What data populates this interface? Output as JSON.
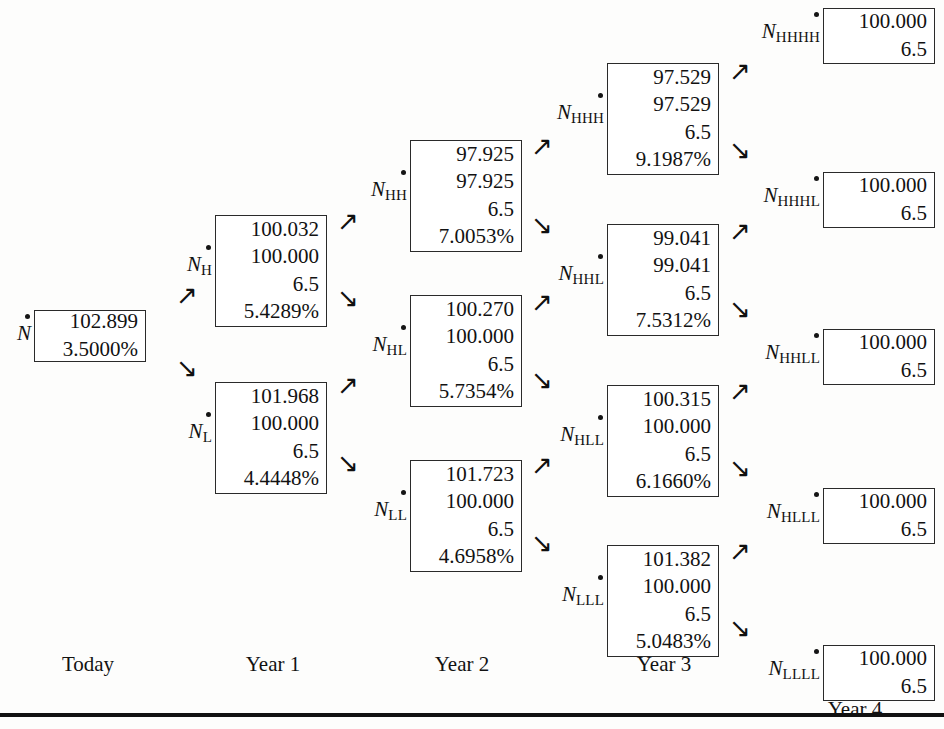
{
  "figure": {
    "type": "binomial-interest-rate-tree",
    "timeline": [
      {
        "label": "Today",
        "x": 88
      },
      {
        "label": "Year 1",
        "x": 273
      },
      {
        "label": "Year 2",
        "x": 462
      },
      {
        "label": "Year 3",
        "x": 664
      },
      {
        "label": "Year 4",
        "x": 855
      }
    ],
    "arrow_up_glyph": "↗",
    "arrow_down_glyph": "↘"
  },
  "nodes": [
    {
      "id": "N",
      "label": "N",
      "subscript": "",
      "values": [
        "102.899",
        "3.5000%"
      ],
      "x": 34,
      "y": 310,
      "w": 112,
      "h": 52,
      "label_w": 22
    },
    {
      "id": "NH",
      "label": "N",
      "subscript": "H",
      "values": [
        "100.032",
        "100.000",
        "6.5",
        "5.4289%"
      ],
      "x": 215,
      "y": 215,
      "w": 112,
      "h": 112,
      "label_w": 34
    },
    {
      "id": "NL",
      "label": "N",
      "subscript": "L",
      "values": [
        "101.968",
        "100.000",
        "6.5",
        "4.4448%"
      ],
      "x": 215,
      "y": 382,
      "w": 112,
      "h": 112,
      "label_w": 34
    },
    {
      "id": "NHH",
      "label": "N",
      "subscript": "HH",
      "values": [
        "97.925",
        "97.925",
        "6.5",
        "7.0053%"
      ],
      "x": 410,
      "y": 140,
      "w": 112,
      "h": 112,
      "label_w": 48
    },
    {
      "id": "NHL",
      "label": "N",
      "subscript": "HL",
      "values": [
        "100.270",
        "100.000",
        "6.5",
        "5.7354%"
      ],
      "x": 410,
      "y": 295,
      "w": 112,
      "h": 112,
      "label_w": 48
    },
    {
      "id": "NLL",
      "label": "N",
      "subscript": "LL",
      "values": [
        "101.723",
        "100.000",
        "6.5",
        "4.6958%"
      ],
      "x": 410,
      "y": 460,
      "w": 112,
      "h": 112,
      "label_w": 48
    },
    {
      "id": "NHHH",
      "label": "N",
      "subscript": "HHH",
      "values": [
        "97.529",
        "97.529",
        "6.5",
        "9.1987%"
      ],
      "x": 607,
      "y": 63,
      "w": 112,
      "h": 112,
      "label_w": 62
    },
    {
      "id": "NHHL",
      "label": "N",
      "subscript": "HHL",
      "values": [
        "99.041",
        "99.041",
        "6.5",
        "7.5312%"
      ],
      "x": 607,
      "y": 224,
      "w": 112,
      "h": 112,
      "label_w": 62
    },
    {
      "id": "NHLL",
      "label": "N",
      "subscript": "HLL",
      "values": [
        "100.315",
        "100.000",
        "6.5",
        "6.1660%"
      ],
      "x": 607,
      "y": 385,
      "w": 112,
      "h": 112,
      "label_w": 62
    },
    {
      "id": "NLLL",
      "label": "N",
      "subscript": "LLL",
      "values": [
        "101.382",
        "100.000",
        "6.5",
        "5.0483%"
      ],
      "x": 607,
      "y": 545,
      "w": 112,
      "h": 112,
      "label_w": 62
    },
    {
      "id": "NHHHH",
      "label": "N",
      "subscript": "HHHH",
      "values": [
        "100.000",
        "6.5"
      ],
      "x": 823,
      "y": 8,
      "w": 112,
      "h": 56,
      "label_w": 76
    },
    {
      "id": "NHHHL",
      "label": "N",
      "subscript": "HHHL",
      "values": [
        "100.000",
        "6.5"
      ],
      "x": 823,
      "y": 172,
      "w": 112,
      "h": 56,
      "label_w": 76
    },
    {
      "id": "NHHLL",
      "label": "N",
      "subscript": "HHLL",
      "values": [
        "100.000",
        "6.5"
      ],
      "x": 823,
      "y": 329,
      "w": 112,
      "h": 56,
      "label_w": 76
    },
    {
      "id": "NHLLL",
      "label": "N",
      "subscript": "HLLL",
      "values": [
        "100.000",
        "6.5"
      ],
      "x": 823,
      "y": 488,
      "w": 112,
      "h": 56,
      "label_w": 76
    },
    {
      "id": "NLLLL",
      "label": "N",
      "subscript": "LLLL",
      "values": [
        "100.000",
        "6.5"
      ],
      "x": 823,
      "y": 645,
      "w": 112,
      "h": 56,
      "label_w": 76
    }
  ],
  "arrows": [
    {
      "id": "N-up",
      "dir": "up",
      "x": 176,
      "y": 282
    },
    {
      "id": "N-down",
      "dir": "down",
      "x": 176,
      "y": 355
    },
    {
      "id": "NH-up",
      "dir": "up",
      "x": 337,
      "y": 208
    },
    {
      "id": "NH-down",
      "dir": "down",
      "x": 337,
      "y": 285
    },
    {
      "id": "NL-up",
      "dir": "up",
      "x": 337,
      "y": 372
    },
    {
      "id": "NL-down",
      "dir": "down",
      "x": 337,
      "y": 450
    },
    {
      "id": "NHH-up",
      "dir": "up",
      "x": 531,
      "y": 133
    },
    {
      "id": "NHH-down",
      "dir": "down",
      "x": 531,
      "y": 212
    },
    {
      "id": "NHL-up",
      "dir": "up",
      "x": 531,
      "y": 289
    },
    {
      "id": "NHL-down",
      "dir": "down",
      "x": 531,
      "y": 367
    },
    {
      "id": "NLL-up",
      "dir": "up",
      "x": 531,
      "y": 452
    },
    {
      "id": "NLL-down",
      "dir": "down",
      "x": 531,
      "y": 530
    },
    {
      "id": "NHHH-up",
      "dir": "up",
      "x": 729,
      "y": 58
    },
    {
      "id": "NHHH-down",
      "dir": "down",
      "x": 729,
      "y": 137
    },
    {
      "id": "NHHL-up",
      "dir": "up",
      "x": 729,
      "y": 218
    },
    {
      "id": "NHHL-down",
      "dir": "down",
      "x": 729,
      "y": 296
    },
    {
      "id": "NHLL-up",
      "dir": "up",
      "x": 729,
      "y": 378
    },
    {
      "id": "NHLL-down",
      "dir": "down",
      "x": 729,
      "y": 455
    },
    {
      "id": "NLLL-up",
      "dir": "up",
      "x": 729,
      "y": 538
    },
    {
      "id": "NLLL-down",
      "dir": "down",
      "x": 729,
      "y": 615
    }
  ],
  "baseline": {
    "y": 713
  }
}
